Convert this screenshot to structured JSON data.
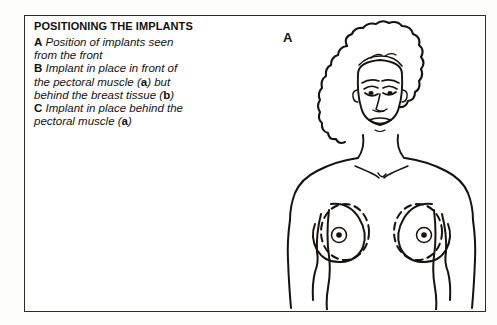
{
  "figure": {
    "title": "POSITIONING THE IMPLANTS",
    "panel_label": "A",
    "caption_lines": [
      {
        "marker": "A",
        "text": "Position of implants seen"
      },
      {
        "marker": "",
        "text": "from the front"
      },
      {
        "marker": "B",
        "text": "Implant in place in front of"
      },
      {
        "marker": "",
        "text": "the pectoral muscle (a) but"
      },
      {
        "marker": "",
        "text": "behind the breast tissue (b)"
      },
      {
        "marker": "C",
        "text": "Implant in place behind the"
      },
      {
        "marker": "",
        "text": "pectoral muscle (a)"
      }
    ],
    "caption_segments": {
      "line1_marker": "A",
      "line1_text": " Position of implants seen",
      "line2_text": "from the front",
      "line3_marker": "B",
      "line3_text": " Implant in place in front of",
      "line4_pre": "the pectoral muscle (",
      "line4_bold": "a",
      "line4_post": ") but",
      "line5_pre": "behind the breast tissue (",
      "line5_bold": "b",
      "line5_post": ")",
      "line6_marker": "C",
      "line6_text": " Implant in place behind the",
      "line7_pre": "pectoral muscle (",
      "line7_bold": "a",
      "line7_post": ")"
    }
  },
  "illustration": {
    "description": "Line drawing of a female torso seen from the front with curly hair, showing dashed oval implant outlines over both breasts",
    "parts": [
      "hair",
      "face",
      "eyes",
      "nose",
      "mouth",
      "neck",
      "shoulders",
      "collarbone",
      "left-arm",
      "right-arm",
      "left-breast",
      "right-breast",
      "left-implant-outline",
      "right-implant-outline",
      "left-nipple",
      "right-nipple"
    ]
  },
  "colors": {
    "ink": "#16120f",
    "frame": "#2b2b2b",
    "page_background": "#fdfdfb",
    "panel_background": "#ffffff"
  }
}
